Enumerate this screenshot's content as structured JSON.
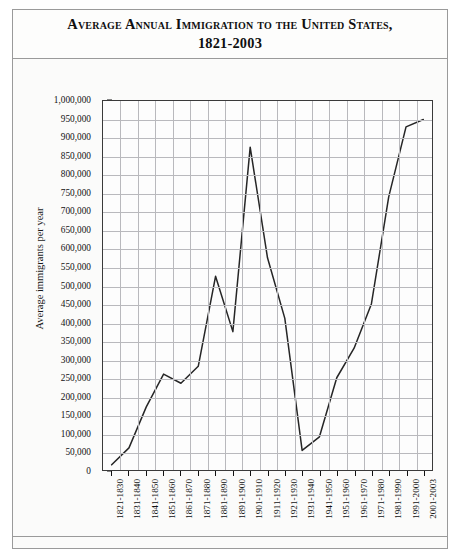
{
  "figure": {
    "title": "Average Annual Immigration to the United States,\n1821-2003"
  },
  "chart_data": {
    "type": "line",
    "title": "Average Annual Immigration to the United States, 1821-2003",
    "xlabel": "",
    "ylabel": "Average immigrants per year",
    "ylim": [
      0,
      1000000
    ],
    "ytick_step": 50000,
    "grid": true,
    "legend": false,
    "categories": [
      "1821-1830",
      "1831-1840",
      "1841-1850",
      "1851-1860",
      "1861-1870",
      "1871-1880",
      "1881-1890",
      "1891-1900",
      "1901-1910",
      "1911-1920",
      "1921-1930",
      "1931-1940",
      "1941-1950",
      "1951-1960",
      "1961-1970",
      "1971-1980",
      "1981-1990",
      "1991-2000",
      "2001-2003"
    ],
    "values": [
      14000,
      60000,
      171000,
      260000,
      235000,
      281000,
      525000,
      375000,
      875000,
      575000,
      411000,
      53000,
      90000,
      250000,
      330000,
      450000,
      740000,
      930000,
      950000
    ],
    "ytick_labels": [
      "1,000,000",
      "950,000",
      "900,000",
      "850,000",
      "800,000",
      "750,000",
      "700,000",
      "650,000",
      "600,000",
      "550,000",
      "500,000",
      "450,000",
      "400,000",
      "350,000",
      "300,000",
      "250,000",
      "200,000",
      "150,000",
      "100,000",
      "50,000",
      "0"
    ],
    "ytick_values": [
      1000000,
      950000,
      900000,
      850000,
      800000,
      750000,
      700000,
      650000,
      600000,
      550000,
      500000,
      450000,
      400000,
      350000,
      300000,
      250000,
      200000,
      150000,
      100000,
      50000,
      0
    ],
    "line_color": "#262626",
    "grid_color": "#b9b9bd",
    "axis_color": "#3a3a3a"
  }
}
